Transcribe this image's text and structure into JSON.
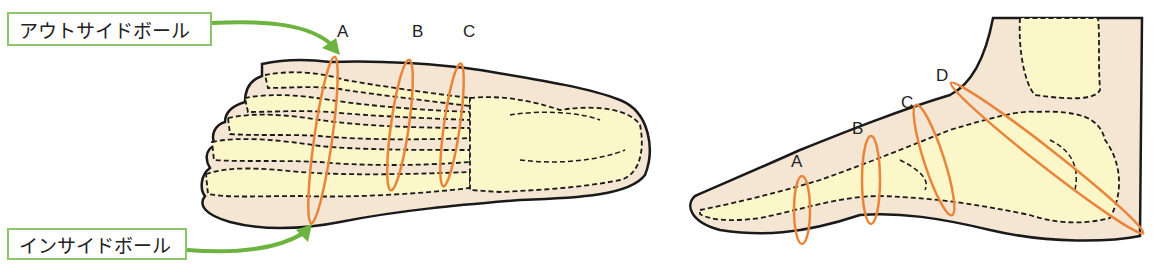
{
  "callouts": {
    "outside_ball": "アウトサイドボール",
    "inside_ball": "インサイドボール"
  },
  "top_view": {
    "sections": [
      {
        "id": "A",
        "label": "A"
      },
      {
        "id": "B",
        "label": "B"
      },
      {
        "id": "C",
        "label": "C"
      }
    ]
  },
  "side_view": {
    "sections": [
      {
        "id": "A",
        "label": "A"
      },
      {
        "id": "B",
        "label": "B"
      },
      {
        "id": "C",
        "label": "C"
      },
      {
        "id": "D",
        "label": "D"
      }
    ]
  },
  "colors": {
    "skin": "#f5e6d3",
    "bone": "#fbf7c9",
    "ring": "#e8853a",
    "arrow": "#6cb33f",
    "box_border": "#8cc56a",
    "outline": "#1a1a1a"
  }
}
